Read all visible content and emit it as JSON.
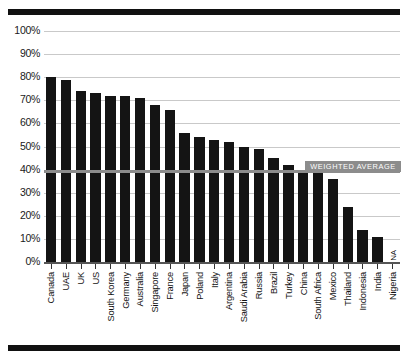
{
  "chart_data": {
    "type": "bar",
    "title": "",
    "subtitle": "",
    "xlabel": "",
    "ylabel": "",
    "ylim": [
      0,
      100
    ],
    "grid": true,
    "legend": "none",
    "value_suffix": "%",
    "categories": [
      "Canada",
      "UAE",
      "UK",
      "US",
      "South Korea",
      "Germany",
      "Australia",
      "Singapore",
      "France",
      "Japan",
      "Poland",
      "Italy",
      "Argentina",
      "Saudi Arabia",
      "Russia",
      "Brazil",
      "Turkey",
      "China",
      "South Africa",
      "Mexico",
      "Thailand",
      "Indonesia",
      "India",
      "Nigeria"
    ],
    "values": [
      80,
      79,
      74,
      73,
      72,
      72,
      71,
      68,
      66,
      56,
      54,
      53,
      52,
      50,
      49,
      45,
      42,
      40,
      40,
      36,
      24,
      14,
      11,
      null
    ],
    "value_notes": [
      "",
      "",
      "",
      "",
      "",
      "",
      "",
      "",
      "",
      "",
      "",
      "",
      "",
      "",
      "",
      "",
      "",
      "",
      "",
      "",
      "",
      "",
      "",
      "NA"
    ],
    "ytick_labels": [
      "100%",
      "90%",
      "80%",
      "70%",
      "60%",
      "50%",
      "40%",
      "30%",
      "20%",
      "10%",
      "0%"
    ],
    "ytick_values": [
      100,
      90,
      80,
      70,
      60,
      50,
      40,
      30,
      20,
      10,
      0
    ],
    "annotations": [
      {
        "name": "weighted-average",
        "label": "WEIGHTED AVERAGE",
        "value": 39,
        "type": "hline"
      }
    ],
    "colors": {
      "bar": "#141414",
      "gridline": "#c9c9c9",
      "average_line": "#8c8c8c",
      "average_badge_bg": "#8c8c8c",
      "average_badge_text": "#ffffff",
      "rule": "#111111",
      "axis_text": "#1a1a1a"
    }
  },
  "labels": {
    "na_text": "NA"
  }
}
